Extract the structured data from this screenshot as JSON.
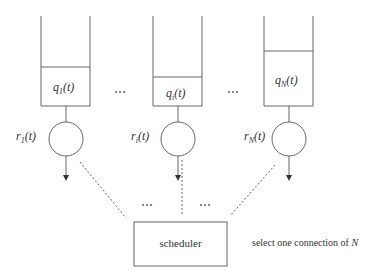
{
  "diagram": {
    "queues": [
      {
        "id": "1",
        "queue_label": {
          "base": "q",
          "sub": "1",
          "arg": "(t)"
        },
        "rate_label": {
          "base": "r",
          "sub": "1",
          "arg": "(t)"
        }
      },
      {
        "id": "i",
        "queue_label": {
          "base": "q",
          "sub": "i",
          "arg": "(t)"
        },
        "rate_label": {
          "base": "r",
          "sub": "i",
          "arg": "(t)"
        }
      },
      {
        "id": "N",
        "queue_label": {
          "base": "q",
          "sub": "N",
          "arg": "(t)"
        },
        "rate_label": {
          "base": "r",
          "sub": "N",
          "arg": "(t)"
        }
      }
    ],
    "ellipsis": "⋯",
    "scheduler_label": "scheduler",
    "annotation": {
      "text": "select one connection of ",
      "var": "N"
    },
    "colors": {
      "stroke": "#666666",
      "text": "#333333",
      "background": "#ffffff"
    }
  }
}
